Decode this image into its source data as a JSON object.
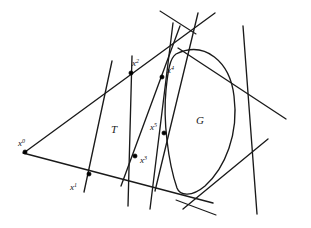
{
  "figure": {
    "background_color": "#ffffff",
    "stroke_color": "#1a1a1a",
    "hatch_color": "#444444",
    "width": 311,
    "height": 228
  },
  "labels": {
    "x0": {
      "base": "x",
      "sup": "0",
      "x": 18,
      "y": 146
    },
    "x1": {
      "base": "x",
      "sup": "1",
      "x": 70,
      "y": 190
    },
    "x2": {
      "base": "x",
      "sup": "2",
      "x": 132,
      "y": 66
    },
    "x3": {
      "base": "x",
      "sup": "3",
      "x": 140,
      "y": 163
    },
    "x4": {
      "base": "x",
      "sup": "4",
      "x": 167,
      "y": 73
    },
    "x5": {
      "base": "x",
      "sup": "5",
      "x": 150,
      "y": 130
    },
    "T": {
      "text": "T",
      "x": 111,
      "y": 133
    },
    "G": {
      "text": "G",
      "x": 196,
      "y": 124
    }
  },
  "points": [
    {
      "name": "x0",
      "x": 25,
      "y": 152
    },
    {
      "name": "x1",
      "x": 89,
      "y": 174
    },
    {
      "name": "x2",
      "x": 131,
      "y": 73
    },
    {
      "name": "x3",
      "x": 135,
      "y": 156
    },
    {
      "name": "x4",
      "x": 162,
      "y": 77
    },
    {
      "name": "x5",
      "x": 164,
      "y": 133
    }
  ],
  "lines": [
    {
      "name": "triangle-upper-edge",
      "x1": 25,
      "y1": 152,
      "x2": 215,
      "y2": 13,
      "weight": "med"
    },
    {
      "name": "triangle-lower-edge",
      "x1": 23,
      "y1": 153,
      "x2": 213,
      "y2": 203,
      "weight": "med"
    },
    {
      "name": "cut-1-through-x1",
      "x1": 112,
      "y1": 61,
      "x2": 84,
      "y2": 192,
      "weight": "med"
    },
    {
      "name": "cut-2-through-x2-x3",
      "x1": 132,
      "y1": 56,
      "x2": 128,
      "y2": 206,
      "weight": "med"
    },
    {
      "name": "cut-3-through-x3-x4",
      "x1": 121,
      "y1": 186,
      "x2": 180,
      "y2": 26,
      "weight": "med"
    },
    {
      "name": "cut-4-through-x5",
      "x1": 173,
      "y1": 23,
      "x2": 150,
      "y2": 209,
      "weight": "med"
    },
    {
      "name": "cut-5-through-x4-x5",
      "x1": 155,
      "y1": 191,
      "x2": 198,
      "y2": 13,
      "weight": "med"
    },
    {
      "name": "tangent-top-right",
      "x1": 178,
      "y1": 48,
      "x2": 286,
      "y2": 119,
      "weight": "med"
    },
    {
      "name": "tangent-right-side",
      "x1": 243,
      "y1": 26,
      "x2": 257,
      "y2": 214,
      "weight": "med"
    },
    {
      "name": "tangent-bottom",
      "x1": 183,
      "y1": 209,
      "x2": 268,
      "y2": 139,
      "weight": "med"
    },
    {
      "name": "tick-top-left",
      "x1": 160,
      "y1": 11,
      "x2": 196,
      "y2": 34,
      "weight": "thin"
    },
    {
      "name": "tick-bottom-left",
      "x1": 176,
      "y1": 200,
      "x2": 216,
      "y2": 215,
      "weight": "thin"
    }
  ],
  "region_G": {
    "name": "convex-set-G",
    "hatch_angle_deg": 45,
    "hatch_spacing_px": 2.4,
    "path": "M 176 54 C 205 40 230 62 234 96 C 239 134 225 168 205 186 C 192 197 180 196 177 188 C 168 162 163 120 166 90 C 168 70 170 58 176 54 Z"
  }
}
